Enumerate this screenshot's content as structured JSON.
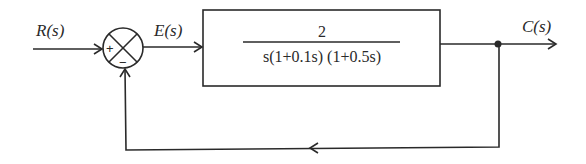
{
  "diagram": {
    "type": "closed-loop block diagram (unity negative feedback)",
    "signals": {
      "input": "R(s)",
      "error": "E(s)",
      "output": "C(s)"
    },
    "summing_junction": {
      "plus_sign": "+",
      "minus_sign": "−"
    },
    "block": {
      "numerator": "2",
      "denominator": "s(1+0.1s) (1+0.5s)"
    },
    "colors": {
      "stroke": "#2a2a2a",
      "background": "#ffffff"
    }
  }
}
